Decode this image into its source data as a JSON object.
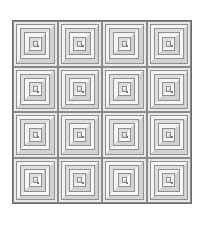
{
  "image": {
    "description": "Log cabin quilt pattern, 4x4 grid of square blocks with concentric gray strips",
    "rows": 4,
    "columns": 4,
    "block_rings": 5,
    "colors": {
      "border": "#6a6a6a",
      "strip_light": "#f4f4f4",
      "strip_dark": "#d2d2d2",
      "center": "#cfcfcf",
      "background": "#ffffff"
    }
  }
}
